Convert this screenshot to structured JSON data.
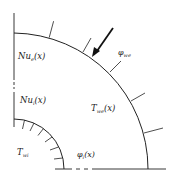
{
  "diagram": {
    "labels": {
      "nu_outer": {
        "main": "Nu",
        "sub": "e",
        "arg": "(x)"
      },
      "nu_inner": {
        "main": "Nu",
        "sub": "i",
        "arg": "(x)"
      },
      "t_outer": {
        "main": "T",
        "sub": "w",
        "subsub": "e",
        "arg": "(x)"
      },
      "t_inner": {
        "main": "T",
        "sub": "w",
        "subsub": "i"
      },
      "phi_outer": {
        "main": "φ",
        "sub": "w",
        "subsub": "e"
      },
      "phi_inner": {
        "main": "φ",
        "sub": "i",
        "arg": "(x)"
      }
    },
    "colors": {
      "stroke": "#222222",
      "background": "#ffffff"
    }
  }
}
